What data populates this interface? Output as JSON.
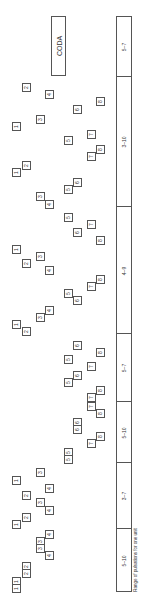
{
  "coda_label": "CODA",
  "caption": "Range of pulsations for one unit",
  "segments": [
    {
      "label": "5–7",
      "top": 0,
      "height": 59
    },
    {
      "label": "3–10",
      "top": 59,
      "height": 130
    },
    {
      "label": "4–9",
      "top": 189,
      "height": 127
    },
    {
      "label": "5–7",
      "top": 316,
      "height": 68
    },
    {
      "label": "5–10",
      "top": 384,
      "height": 61
    },
    {
      "label": "3–7",
      "top": 445,
      "height": 66
    },
    {
      "label": "5–10",
      "top": 511,
      "height": 63
    }
  ],
  "boxes": [
    {
      "n": "2",
      "x": 22,
      "y": 83
    },
    {
      "n": "4",
      "x": 45,
      "y": 90
    },
    {
      "n": "8",
      "x": 96,
      "y": 97
    },
    {
      "n": "6",
      "x": 73,
      "y": 105
    },
    {
      "n": "3",
      "x": 36,
      "y": 115
    },
    {
      "n": "1",
      "x": 12,
      "y": 122
    },
    {
      "n": "7",
      "x": 87,
      "y": 130
    },
    {
      "n": "5",
      "x": 64,
      "y": 136
    },
    {
      "n": "8",
      "x": 96,
      "y": 145
    },
    {
      "n": "7",
      "x": 87,
      "y": 152
    },
    {
      "n": "2",
      "x": 22,
      "y": 161
    },
    {
      "n": "1",
      "x": 12,
      "y": 168
    },
    {
      "n": "6",
      "x": 73,
      "y": 178
    },
    {
      "n": "5",
      "x": 64,
      "y": 185
    },
    {
      "n": "3",
      "x": 36,
      "y": 192
    },
    {
      "n": "4",
      "x": 45,
      "y": 200
    },
    {
      "n": "5",
      "x": 64,
      "y": 213
    },
    {
      "n": "7",
      "x": 87,
      "y": 220
    },
    {
      "n": "6",
      "x": 73,
      "y": 228
    },
    {
      "n": "8",
      "x": 96,
      "y": 236
    },
    {
      "n": "1",
      "x": 12,
      "y": 245
    },
    {
      "n": "3",
      "x": 36,
      "y": 252
    },
    {
      "n": "2",
      "x": 22,
      "y": 259
    },
    {
      "n": "4",
      "x": 45,
      "y": 266
    },
    {
      "n": "8",
      "x": 96,
      "y": 275
    },
    {
      "n": "7",
      "x": 87,
      "y": 282
    },
    {
      "n": "5",
      "x": 64,
      "y": 289
    },
    {
      "n": "6",
      "x": 73,
      "y": 296
    },
    {
      "n": "4",
      "x": 45,
      "y": 306
    },
    {
      "n": "3",
      "x": 36,
      "y": 313
    },
    {
      "n": "1",
      "x": 12,
      "y": 320
    },
    {
      "n": "2",
      "x": 22,
      "y": 327
    },
    {
      "n": "6",
      "x": 73,
      "y": 341
    },
    {
      "n": "8",
      "x": 96,
      "y": 348
    },
    {
      "n": "5",
      "x": 64,
      "y": 355
    },
    {
      "n": "7",
      "x": 87,
      "y": 362
    },
    {
      "n": "6",
      "x": 73,
      "y": 371
    },
    {
      "n": "5",
      "x": 64,
      "y": 378
    },
    {
      "n": "8",
      "x": 96,
      "y": 386
    },
    {
      "n": "7",
      "x": 87,
      "y": 393
    },
    {
      "n": "7",
      "x": 87,
      "y": 402
    },
    {
      "n": "8",
      "x": 96,
      "y": 409
    },
    {
      "n": "6",
      "x": 73,
      "y": 418
    },
    {
      "n": "6",
      "x": 73,
      "y": 425
    },
    {
      "n": "8",
      "x": 96,
      "y": 432
    },
    {
      "n": "7",
      "x": 87,
      "y": 439
    },
    {
      "n": "5",
      "x": 64,
      "y": 448
    },
    {
      "n": "5",
      "x": 64,
      "y": 455
    },
    {
      "n": "3",
      "x": 36,
      "y": 468
    },
    {
      "n": "1",
      "x": 12,
      "y": 476
    },
    {
      "n": "4",
      "x": 45,
      "y": 484
    },
    {
      "n": "2",
      "x": 22,
      "y": 491
    },
    {
      "n": "3",
      "x": 36,
      "y": 498
    },
    {
      "n": "4",
      "x": 45,
      "y": 506
    },
    {
      "n": "2",
      "x": 22,
      "y": 513
    },
    {
      "n": "1",
      "x": 12,
      "y": 520
    },
    {
      "n": "4",
      "x": 45,
      "y": 530
    },
    {
      "n": "3",
      "x": 36,
      "y": 537
    },
    {
      "n": "3",
      "x": 36,
      "y": 544
    },
    {
      "n": "4",
      "x": 45,
      "y": 551
    },
    {
      "n": "2",
      "x": 22,
      "y": 562
    },
    {
      "n": "2",
      "x": 22,
      "y": 569
    },
    {
      "n": "1",
      "x": 12,
      "y": 577
    },
    {
      "n": "1",
      "x": 12,
      "y": 584
    }
  ]
}
